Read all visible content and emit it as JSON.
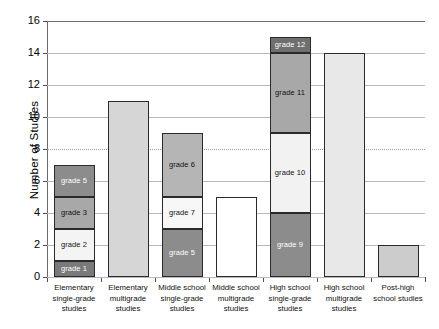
{
  "chart_data": {
    "type": "bar",
    "subtype": "stacked-bar",
    "title": "",
    "xlabel": "",
    "ylabel": "Number of Studies",
    "ylim": [
      0,
      16
    ],
    "ytick_values": [
      0,
      2,
      4,
      6,
      8,
      10,
      12,
      14,
      16
    ],
    "ytick_labels": [
      "0",
      "2",
      "4",
      "6",
      "8",
      "10",
      "12",
      "14",
      "16"
    ],
    "grid": true,
    "grid_axis": "y",
    "legend": "none",
    "legend_position": "none",
    "categories": [
      "Elementary single-grade studies",
      "Elementary multigrade studies",
      "Middle school single-grade studies",
      "Middle school multigrade studies",
      "High school single-grade studies",
      "High school multigrade studies",
      "Post-high school studies"
    ],
    "totals": [
      7,
      11,
      9,
      5,
      15,
      14,
      2
    ],
    "bars": [
      {
        "category": "Elementary single-grade studies",
        "label_lines": [
          "Elementary",
          "single-grade",
          "studies"
        ],
        "total": 7,
        "segments": [
          {
            "label": "grade 1",
            "value": 1,
            "from": 0,
            "to": 1,
            "color": "#7a7a7a",
            "label_color": "light"
          },
          {
            "label": "grade 2",
            "value": 2,
            "from": 1,
            "to": 3,
            "color": "#f4f4f4",
            "label_color": "dark"
          },
          {
            "label": "grade 3",
            "value": 2,
            "from": 3,
            "to": 5,
            "color": "#a8a8a8",
            "label_color": "dark"
          },
          {
            "label": "grade 5",
            "value": 2,
            "from": 5,
            "to": 7,
            "color": "#8c8c8c",
            "label_color": "light"
          }
        ]
      },
      {
        "category": "Elementary multigrade studies",
        "label_lines": [
          "Elementary",
          "multigrade",
          "studies"
        ],
        "total": 11,
        "segments": [
          {
            "label": "",
            "value": 11,
            "from": 0,
            "to": 11,
            "color": "#d6d6d6",
            "label_color": "dark"
          }
        ]
      },
      {
        "category": "Middle school single-grade studies",
        "label_lines": [
          "Middle school",
          "single-grade",
          "studies"
        ],
        "total": 9,
        "segments": [
          {
            "label": "grade 5",
            "value": 3,
            "from": 0,
            "to": 3,
            "color": "#8c8c8c",
            "label_color": "light"
          },
          {
            "label": "grade 7",
            "value": 2,
            "from": 3,
            "to": 5,
            "color": "#f7f7f7",
            "label_color": "dark"
          },
          {
            "label": "grade 6",
            "value": 4,
            "from": 5,
            "to": 9,
            "color": "#b5b5b5",
            "label_color": "dark"
          }
        ]
      },
      {
        "category": "Middle school multigrade studies",
        "label_lines": [
          "Middle school",
          "multigrade",
          "studies"
        ],
        "total": 5,
        "segments": [
          {
            "label": "",
            "value": 5,
            "from": 0,
            "to": 5,
            "color": "#ffffff",
            "label_color": "dark"
          }
        ]
      },
      {
        "category": "High school single-grade studies",
        "label_lines": [
          "High school",
          "single-grade",
          "studies"
        ],
        "total": 15,
        "segments": [
          {
            "label": "grade 9",
            "value": 4,
            "from": 0,
            "to": 4,
            "color": "#8c8c8c",
            "label_color": "light"
          },
          {
            "label": "grade 10",
            "value": 5,
            "from": 4,
            "to": 9,
            "color": "#f2f2f2",
            "label_color": "dark"
          },
          {
            "label": "grade 11",
            "value": 5,
            "from": 9,
            "to": 14,
            "color": "#a8a8a8",
            "label_color": "dark"
          },
          {
            "label": "grade 12",
            "value": 1,
            "from": 14,
            "to": 15,
            "color": "#6f6f6f",
            "label_color": "light"
          }
        ]
      },
      {
        "category": "High school multigrade studies",
        "label_lines": [
          "High school",
          "multigrade",
          "studies"
        ],
        "total": 14,
        "segments": [
          {
            "label": "",
            "value": 14,
            "from": 0,
            "to": 14,
            "color": "#e8e8e8",
            "label_color": "dark"
          }
        ]
      },
      {
        "category": "Post-high school studies",
        "label_lines": [
          "Post-high",
          "school studies"
        ],
        "total": 2,
        "segments": [
          {
            "label": "",
            "value": 2,
            "from": 0,
            "to": 2,
            "color": "#cccccc",
            "label_color": "dark"
          }
        ]
      }
    ]
  }
}
